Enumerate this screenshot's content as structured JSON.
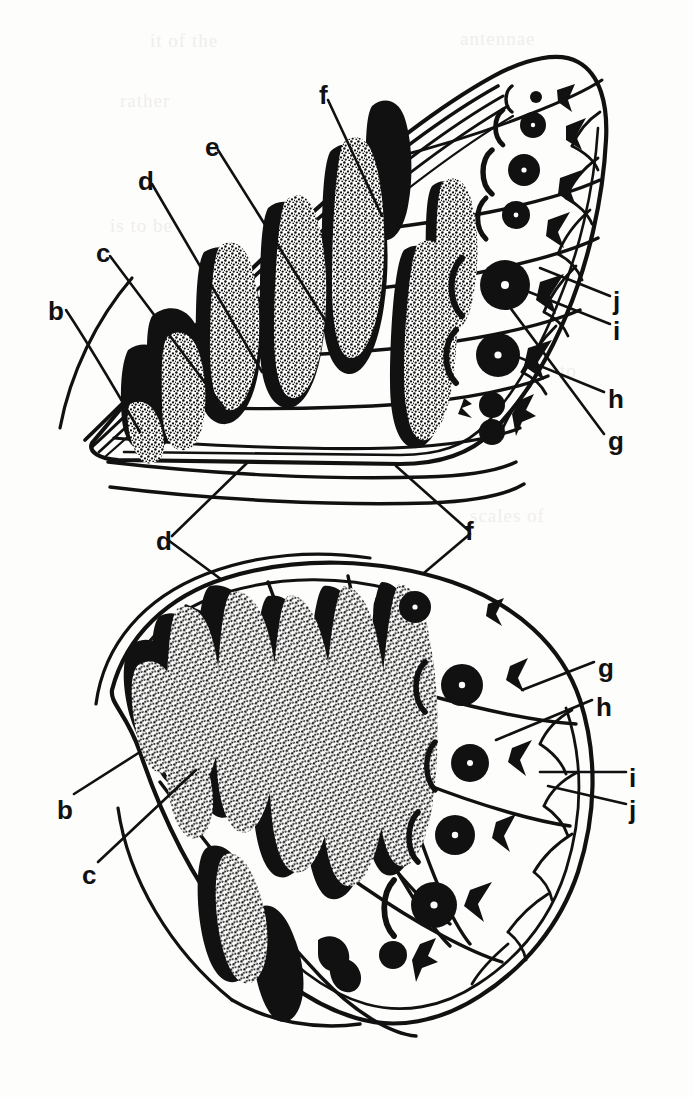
{
  "figure": {
    "background_color": "#fdfdfc",
    "ink_color": "#111111",
    "width": 693,
    "height": 1097
  },
  "ghost_text": [
    {
      "t": "it of the",
      "x": 150,
      "y": 30
    },
    {
      "t": "antennae",
      "x": 460,
      "y": 28
    },
    {
      "t": "rather",
      "x": 120,
      "y": 90
    },
    {
      "t": "of the",
      "x": 430,
      "y": 150
    },
    {
      "t": "is to be",
      "x": 110,
      "y": 215
    },
    {
      "t": "elongate",
      "x": 455,
      "y": 300
    },
    {
      "t": "to",
      "x": 560,
      "y": 360
    },
    {
      "t": "the",
      "x": 150,
      "y": 440
    },
    {
      "t": "scales of",
      "x": 470,
      "y": 505
    },
    {
      "t": "THE FAMILY WASPIDAE",
      "x": 210,
      "y": 690
    },
    {
      "t": "the wing surface",
      "x": 180,
      "y": 738
    },
    {
      "t": "that the scales are",
      "x": 190,
      "y": 768
    },
    {
      "t": "in the costal",
      "x": 230,
      "y": 800
    },
    {
      "t": "the veins of",
      "x": 220,
      "y": 830
    },
    {
      "t": "to be rather",
      "x": 200,
      "y": 862
    },
    {
      "t": "on the wing",
      "x": 210,
      "y": 892
    },
    {
      "t": "and the",
      "x": 215,
      "y": 925
    }
  ],
  "forewing": {
    "name": "forewing",
    "eyespots": [
      {
        "id": "fw-ocellus-1",
        "cx": 536,
        "cy": 97,
        "r": 6,
        "pupil": 0
      },
      {
        "id": "fw-ocellus-2",
        "cx": 533,
        "cy": 125,
        "r": 13,
        "pupil": 2.2
      },
      {
        "id": "fw-ocellus-3",
        "cx": 524,
        "cy": 170,
        "r": 16,
        "pupil": 2.6
      },
      {
        "id": "fw-ocellus-4",
        "cx": 516,
        "cy": 215,
        "r": 14,
        "pupil": 2.4
      },
      {
        "id": "fw-ocellus-5",
        "cx": 505,
        "cy": 285,
        "r": 25,
        "pupil": 4.0
      },
      {
        "id": "fw-ocellus-6",
        "cx": 498,
        "cy": 355,
        "r": 22,
        "pupil": 3.6
      },
      {
        "id": "fw-ocellus-7a",
        "cx": 492,
        "cy": 405,
        "r": 13,
        "pupil": 0
      },
      {
        "id": "fw-ocellus-7b",
        "cx": 492,
        "cy": 432,
        "r": 13,
        "pupil": 0
      }
    ],
    "labels": [
      {
        "id": "fw-b",
        "text": "b",
        "x": 48,
        "y": 298
      },
      {
        "id": "fw-c",
        "text": "c",
        "x": 96,
        "y": 240
      },
      {
        "id": "fw-d",
        "text": "d",
        "x": 138,
        "y": 168
      },
      {
        "id": "fw-e",
        "text": "e",
        "x": 205,
        "y": 134
      },
      {
        "id": "fw-f",
        "text": "f",
        "x": 319,
        "y": 82
      },
      {
        "id": "fw-j",
        "text": "j",
        "x": 613,
        "y": 288
      },
      {
        "id": "fw-i",
        "text": "i",
        "x": 613,
        "y": 318
      },
      {
        "id": "fw-h",
        "text": "h",
        "x": 608,
        "y": 386
      },
      {
        "id": "fw-g",
        "text": "g",
        "x": 608,
        "y": 428
      }
    ]
  },
  "hindwing": {
    "name": "hindwing",
    "eyespots": [
      {
        "id": "hw-ocellus-1",
        "cx": 415,
        "cy": 607,
        "r": 16,
        "pupil": 2.6
      },
      {
        "id": "hw-ocellus-2",
        "cx": 462,
        "cy": 685,
        "r": 21,
        "pupil": 3.2
      },
      {
        "id": "hw-ocellus-3",
        "cx": 470,
        "cy": 763,
        "r": 19,
        "pupil": 3.0
      },
      {
        "id": "hw-ocellus-4",
        "cx": 455,
        "cy": 835,
        "r": 20,
        "pupil": 3.2
      },
      {
        "id": "hw-ocellus-5",
        "cx": 434,
        "cy": 905,
        "r": 23,
        "pupil": 3.6
      },
      {
        "id": "hw-ocellus-6",
        "cx": 393,
        "cy": 955,
        "r": 14,
        "pupil": 0
      }
    ],
    "labels": [
      {
        "id": "hw-d",
        "text": "d",
        "x": 156,
        "y": 528
      },
      {
        "id": "hw-f",
        "text": "f",
        "x": 465,
        "y": 518
      },
      {
        "id": "hw-g",
        "text": "g",
        "x": 598,
        "y": 655
      },
      {
        "id": "hw-h",
        "text": "h",
        "x": 596,
        "y": 694
      },
      {
        "id": "hw-i",
        "text": "i",
        "x": 629,
        "y": 765
      },
      {
        "id": "hw-j",
        "text": "j",
        "x": 629,
        "y": 797
      },
      {
        "id": "hw-b",
        "text": "b",
        "x": 57,
        "y": 797
      },
      {
        "id": "hw-c",
        "text": "c",
        "x": 82,
        "y": 862
      }
    ]
  }
}
